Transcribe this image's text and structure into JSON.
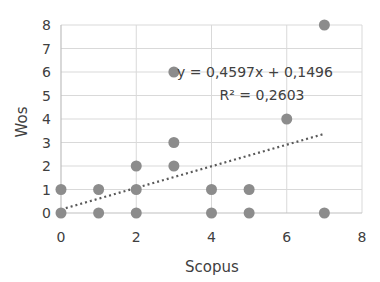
{
  "chart_data": {
    "type": "scatter",
    "title": "",
    "xlabel": "Scopus",
    "ylabel": "Wos",
    "xlim": [
      0,
      8
    ],
    "ylim": [
      0,
      8
    ],
    "xticks": [
      0,
      2,
      4,
      6,
      8
    ],
    "yticks": [
      0,
      1,
      2,
      3,
      4,
      5,
      6,
      7,
      8
    ],
    "grid": true,
    "legend": null,
    "series": [
      {
        "name": "Wos vs Scopus",
        "points": [
          {
            "x": 0,
            "y": 0
          },
          {
            "x": 0,
            "y": 1
          },
          {
            "x": 1,
            "y": 0
          },
          {
            "x": 1,
            "y": 1
          },
          {
            "x": 2,
            "y": 0
          },
          {
            "x": 2,
            "y": 1
          },
          {
            "x": 2,
            "y": 2
          },
          {
            "x": 3,
            "y": 2
          },
          {
            "x": 3,
            "y": 3
          },
          {
            "x": 3,
            "y": 6
          },
          {
            "x": 4,
            "y": 0
          },
          {
            "x": 4,
            "y": 1
          },
          {
            "x": 5,
            "y": 0
          },
          {
            "x": 5,
            "y": 1
          },
          {
            "x": 6,
            "y": 4
          },
          {
            "x": 7,
            "y": 0
          },
          {
            "x": 7,
            "y": 8
          }
        ],
        "color": "#8c8c8c"
      }
    ],
    "trendline": {
      "type": "linear",
      "slope": 0.4597,
      "intercept": 0.1496,
      "x_range": [
        0,
        7
      ],
      "style": "dotted",
      "color": "#5a5a5a",
      "equation_label": "y = 0,4597x + 0,1496",
      "r2_label": "R² = 0,2603"
    }
  }
}
